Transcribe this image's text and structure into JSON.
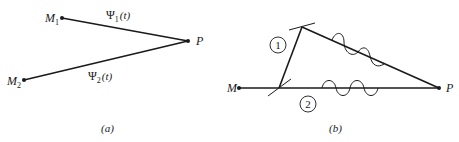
{
  "panel_a": {
    "caption": "(a)",
    "points": {
      "m1": {
        "label": "M",
        "sub": "1"
      },
      "m2": {
        "label": "M",
        "sub": "2"
      },
      "p": {
        "label": "P"
      }
    },
    "paths": [
      {
        "label": "Ψ",
        "sub": "1",
        "arg": "(t)"
      },
      {
        "label": "Ψ",
        "sub": "2",
        "arg": "(t)"
      }
    ]
  },
  "panel_b": {
    "caption": "(b)",
    "points": {
      "m": {
        "label": "M"
      },
      "p": {
        "label": "P"
      }
    },
    "path_markers": [
      "1",
      "2"
    ]
  },
  "colors": {
    "line": "#1a1a1a",
    "background": "#ffffff"
  }
}
